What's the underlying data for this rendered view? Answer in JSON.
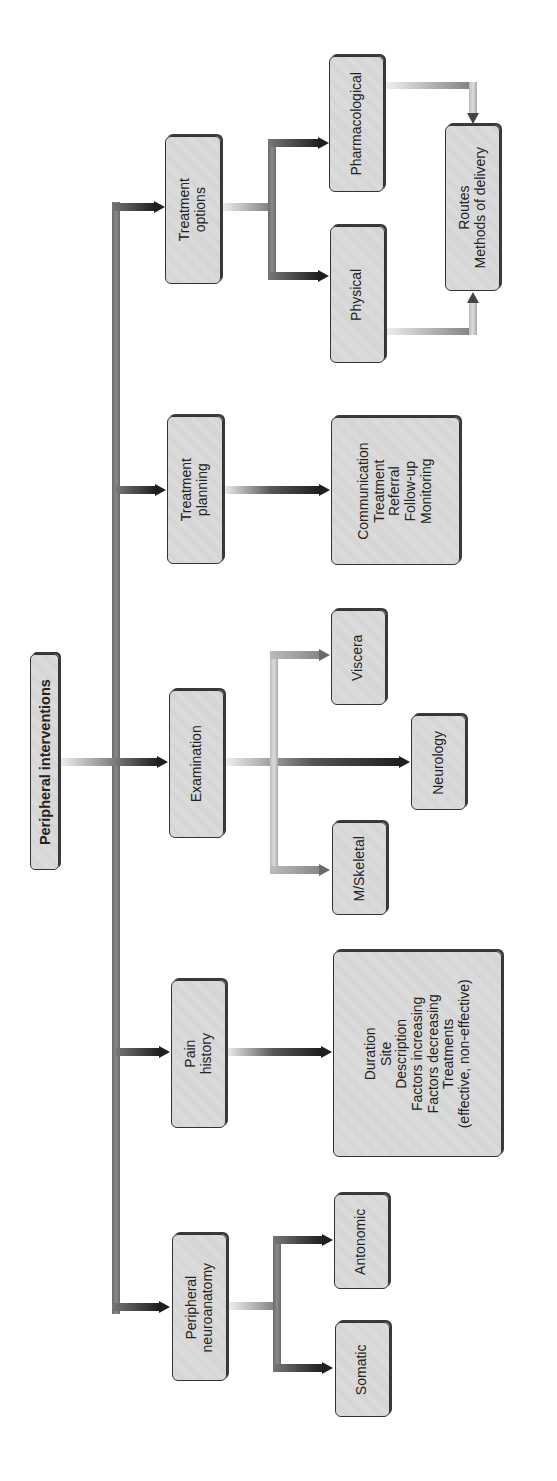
{
  "diagram": {
    "orientation": "rotated-90-ccw",
    "root": {
      "label": "Peripheral interventions"
    },
    "branches": [
      {
        "label": "Treatment\noptions",
        "children": [
          {
            "label": "Pharmacological"
          },
          {
            "label": "Physical"
          }
        ],
        "merge": {
          "label": "Routes\nMethods of delivery"
        }
      },
      {
        "label": "Treatment\nplanning",
        "children": [
          {
            "label": "Communication\nTreatment\nReferral\nFollow-up\nMonitoring"
          }
        ]
      },
      {
        "label": "Examination",
        "children": [
          {
            "label": "Viscera"
          },
          {
            "label": "Neurology"
          },
          {
            "label": "M/Skeletal"
          }
        ]
      },
      {
        "label": "Pain\nhistory",
        "children": [
          {
            "label": "Duration\nSite\nDescription\nFactors increasing\nFactors decreasing\nTreatments\n(effective, non-effective)"
          }
        ]
      },
      {
        "label": "Peripheral\nneuroanatomy",
        "children": [
          {
            "label": "Antonomic"
          },
          {
            "label": "Somatic"
          }
        ]
      }
    ]
  }
}
